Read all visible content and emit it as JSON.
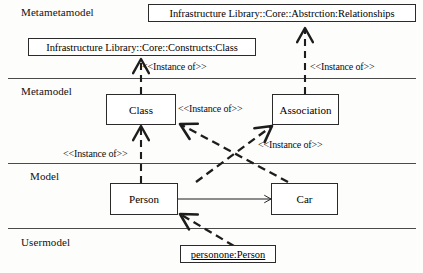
{
  "diagram": {
    "colors": {
      "stroke": "#2b2b2b",
      "separator": "#4a4a4a",
      "background": "#fdfdfc",
      "text": "#000000"
    },
    "layers": [
      {
        "name": "metametamodel",
        "label": "Metametamodel"
      },
      {
        "name": "metamodel",
        "label": "Metamodel"
      },
      {
        "name": "model",
        "label": "Model"
      },
      {
        "name": "usermodel",
        "label": "Usermodel"
      }
    ],
    "nodes": [
      {
        "name": "relationships-package",
        "label": "Infrastructure Library::Core::Abstrction:Relationships"
      },
      {
        "name": "constructs-class-package",
        "label": "Infrastructure Library::Core::Constructs:Class"
      },
      {
        "name": "class-node",
        "label": "Class"
      },
      {
        "name": "association-node",
        "label": "Association"
      },
      {
        "name": "person-node",
        "label": "Person"
      },
      {
        "name": "car-node",
        "label": "Car"
      },
      {
        "name": "personone-instance",
        "label": "personone:Person"
      }
    ],
    "edge_labels": [
      {
        "name": "instance-of-constructs-to-class",
        "label": "<<Instance of>>"
      },
      {
        "name": "instance-of-relationships-to-association",
        "label": "<<Instance of>>"
      },
      {
        "name": "instance-of-class-to-person-left",
        "label": "<<Instance of>>"
      },
      {
        "name": "instance-of-car-to-class",
        "label": "<<Instance of>>"
      },
      {
        "name": "instance-of-person-car-to-association",
        "label": "<<Instance of>>"
      }
    ]
  }
}
